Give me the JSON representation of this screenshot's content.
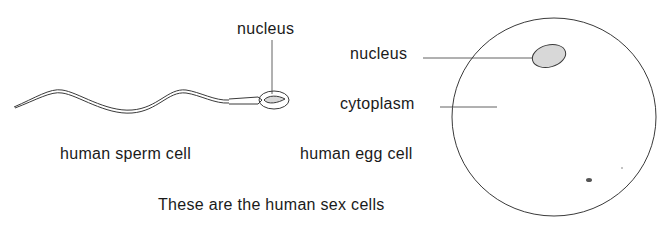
{
  "labels": {
    "sperm_nucleus": "nucleus",
    "sperm_caption": "human sperm cell",
    "egg_nucleus": "nucleus",
    "egg_cytoplasm": "cytoplasm",
    "egg_caption": "human egg cell",
    "figure_caption": "These are the human sex cells"
  },
  "colors": {
    "line": "#3a3a3a",
    "nucleus_fill": "#d8d8d8",
    "background": "#ffffff"
  }
}
